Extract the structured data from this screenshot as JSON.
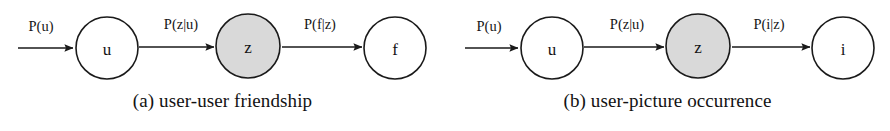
{
  "figure": {
    "background_color": "#ffffff",
    "stroke_color": "#1a1a1a",
    "shaded_node_color": "#d9d9d9",
    "unshaded_node_color": "#ffffff",
    "diagrams": [
      {
        "id": "a",
        "caption": "(a) user-user friendship",
        "nodes": [
          {
            "label": "u",
            "shaded": false,
            "cx": 107,
            "cy": 48,
            "r": 31
          },
          {
            "label": "z",
            "shaded": true,
            "cx": 248,
            "cy": 46,
            "r": 32
          },
          {
            "label": "f",
            "shaded": false,
            "cx": 395,
            "cy": 48,
            "r": 31
          }
        ],
        "edges": [
          {
            "label": "P(u)",
            "x1": 18,
            "x2": 73,
            "y": 48,
            "label_x": 41,
            "label_y": 31
          },
          {
            "label": "P(z|u)",
            "x1": 139,
            "x2": 214,
            "y": 47,
            "label_x": 181,
            "label_y": 29
          },
          {
            "label": "P(f|z)",
            "x1": 282,
            "x2": 362,
            "y": 47,
            "label_x": 320,
            "label_y": 29
          }
        ]
      },
      {
        "id": "b",
        "caption": "(b) user-picture occurrence",
        "nodes": [
          {
            "label": "u",
            "shaded": false,
            "cx": 107,
            "cy": 48,
            "r": 31
          },
          {
            "label": "z",
            "shaded": true,
            "cx": 253,
            "cy": 46,
            "r": 32
          },
          {
            "label": "i",
            "shaded": false,
            "cx": 398,
            "cy": 48,
            "r": 31
          }
        ],
        "edges": [
          {
            "label": "P(u)",
            "x1": 20,
            "x2": 73,
            "y": 48,
            "label_x": 44,
            "label_y": 31
          },
          {
            "label": "P(z|u)",
            "x1": 139,
            "x2": 219,
            "y": 47,
            "label_x": 182,
            "label_y": 29
          },
          {
            "label": "P(i|z)",
            "x1": 287,
            "x2": 365,
            "y": 47,
            "label_x": 324,
            "label_y": 29
          }
        ]
      }
    ]
  }
}
